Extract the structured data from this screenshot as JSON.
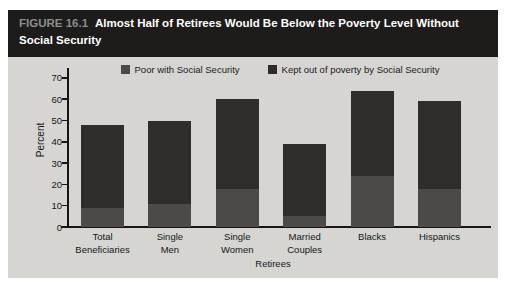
{
  "figure": {
    "label": "FIGURE 16.1",
    "title": "Almost Half of Retirees Would Be Below the Poverty Level Without Social Security"
  },
  "colors": {
    "page_background": "#ffffff",
    "figure_background": "#d6d5d2",
    "header_background": "#1d1c1a",
    "figure_label_text": "#8d8d8d",
    "title_text": "#ffffff",
    "axis": "#151515",
    "series_poor": "#4e4949",
    "series_kept": "#302c2c"
  },
  "chart_data": {
    "type": "bar",
    "stacked": true,
    "title": "Almost Half of Retirees Would Be Below the Poverty Level Without Social Security",
    "categories": [
      "Total\nBeneficiaries",
      "Single\nMen",
      "Single\nWomen",
      "Married\nCouples",
      "Blacks",
      "Hispanics"
    ],
    "series": [
      {
        "name": "Poor with Social Security",
        "color": "#4e4949",
        "values": [
          9,
          11,
          18,
          5,
          24,
          18
        ]
      },
      {
        "name": "Kept out of poverty by Social Security",
        "color": "#302c2c",
        "values": [
          39,
          39,
          42,
          34,
          40,
          41
        ]
      }
    ],
    "totals": [
      48,
      50,
      60,
      39,
      64,
      59
    ],
    "xlabel": "Retirees",
    "ylabel": "Percent",
    "yticks": [
      0,
      10,
      20,
      30,
      40,
      50,
      60,
      70
    ],
    "ylim": [
      0,
      75
    ],
    "grid": false,
    "legend_position": "top"
  }
}
